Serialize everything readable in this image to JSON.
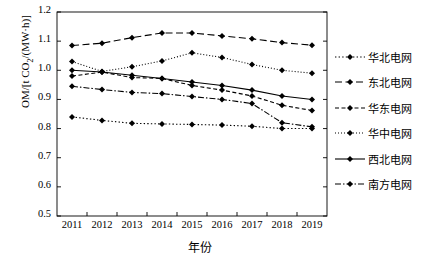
{
  "chart_data": {
    "type": "line",
    "title": "",
    "xlabel": "年份",
    "ylabel": "OM/[t CO2/(MW·h)]",
    "ylabel_main": "OM/[t CO",
    "ylabel_sub": "2",
    "ylabel_tail": "/(MW·h)]",
    "categories": [
      "2011",
      "2012",
      "2013",
      "2014",
      "2015",
      "2016",
      "2017",
      "2018",
      "2019"
    ],
    "xlim": [
      2010.5,
      2019.5
    ],
    "ylim": [
      0.5,
      1.2
    ],
    "yticks": [
      "0.5",
      "0.6",
      "0.7",
      "0.8",
      "0.9",
      "1.0",
      "1.1",
      "1.2"
    ],
    "ytick_values": [
      0.5,
      0.6,
      0.7,
      0.8,
      0.9,
      1.0,
      1.1,
      1.2
    ],
    "grid": false,
    "legend_position": "right",
    "marker": "diamond",
    "color": "#000000",
    "series": [
      {
        "name": "华北电网",
        "style": "dotted",
        "values": [
          0.84,
          0.828,
          0.818,
          0.816,
          0.814,
          0.812,
          0.808,
          0.8,
          0.8
        ]
      },
      {
        "name": "东北电网",
        "style": "dash-long",
        "values": [
          1.085,
          1.093,
          1.112,
          1.128,
          1.128,
          1.118,
          1.108,
          1.095,
          1.086
        ]
      },
      {
        "name": "华东电网",
        "style": "dashed",
        "values": [
          0.98,
          0.994,
          0.975,
          0.972,
          0.948,
          0.932,
          0.912,
          0.88,
          0.862
        ]
      },
      {
        "name": "华中电网",
        "style": "dotted-fine",
        "values": [
          1.03,
          0.996,
          1.012,
          1.032,
          1.06,
          1.044,
          1.02,
          1.0,
          0.99
        ]
      },
      {
        "name": "西北电网",
        "style": "solid",
        "values": [
          1.0,
          0.994,
          0.983,
          0.972,
          0.96,
          0.948,
          0.932,
          0.912,
          0.9
        ]
      },
      {
        "name": "南方电网",
        "style": "dash-dot",
        "values": [
          0.945,
          0.934,
          0.924,
          0.92,
          0.91,
          0.9,
          0.886,
          0.82,
          0.806
        ]
      }
    ]
  },
  "legend": {
    "items": [
      {
        "label": "华北电网"
      },
      {
        "label": "东北电网"
      },
      {
        "label": "华东电网"
      },
      {
        "label": "华中电网"
      },
      {
        "label": "西北电网"
      },
      {
        "label": "南方电网"
      }
    ]
  }
}
